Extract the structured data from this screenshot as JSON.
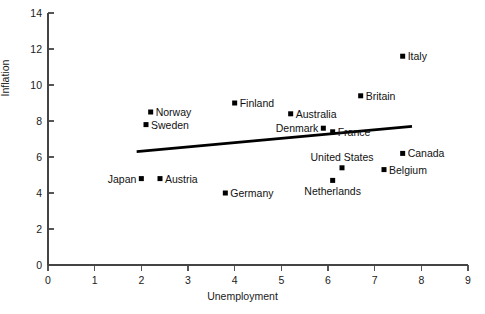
{
  "chart_data": {
    "type": "scatter",
    "title": "",
    "xlabel": "Unemployment",
    "ylabel": "Inflation",
    "xlim": [
      0,
      9
    ],
    "ylim": [
      0,
      14
    ],
    "xticks": [
      "0",
      "1",
      "2",
      "3",
      "4",
      "5",
      "6",
      "7",
      "8",
      "9"
    ],
    "yticks": [
      "0",
      "2",
      "4",
      "6",
      "8",
      "10",
      "12",
      "14"
    ],
    "grid": false,
    "legend": "none",
    "marker_shape": "filled-square",
    "marker_color": "#000000",
    "points": [
      {
        "label": "Italy",
        "x": 7.6,
        "y": 11.6,
        "label_pos": "right"
      },
      {
        "label": "Britain",
        "x": 6.7,
        "y": 9.4,
        "label_pos": "right"
      },
      {
        "label": "Finland",
        "x": 4.0,
        "y": 9.0,
        "label_pos": "right"
      },
      {
        "label": "Australia",
        "x": 5.2,
        "y": 8.4,
        "label_pos": "right"
      },
      {
        "label": "Norway",
        "x": 2.2,
        "y": 8.5,
        "label_pos": "right"
      },
      {
        "label": "Sweden",
        "x": 2.1,
        "y": 7.8,
        "label_pos": "right"
      },
      {
        "label": "Denmark",
        "x": 5.9,
        "y": 7.6,
        "label_pos": "left"
      },
      {
        "label": "France",
        "x": 6.1,
        "y": 7.4,
        "label_pos": "right"
      },
      {
        "label": "Canada",
        "x": 7.6,
        "y": 6.2,
        "label_pos": "right"
      },
      {
        "label": "Belgium",
        "x": 7.2,
        "y": 5.3,
        "label_pos": "right"
      },
      {
        "label": "United States",
        "x": 6.3,
        "y": 5.4,
        "label_pos": "above"
      },
      {
        "label": "Netherlands",
        "x": 6.1,
        "y": 4.7,
        "label_pos": "below"
      },
      {
        "label": "Japan",
        "x": 2.0,
        "y": 4.8,
        "label_pos": "left"
      },
      {
        "label": "Austria",
        "x": 2.4,
        "y": 4.8,
        "label_pos": "right"
      },
      {
        "label": "Germany",
        "x": 3.8,
        "y": 4.0,
        "label_pos": "right"
      }
    ],
    "trendline": {
      "name": "fitted-regression-line",
      "x_start": 1.9,
      "y_start": 6.3,
      "x_end": 7.8,
      "y_end": 7.7
    }
  }
}
